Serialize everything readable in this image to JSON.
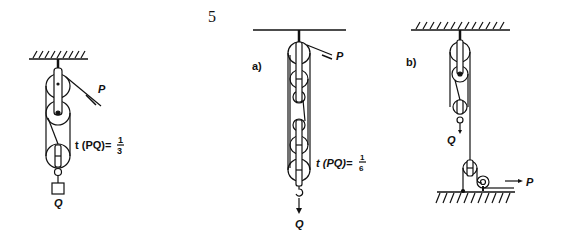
{
  "figure": {
    "number": "5",
    "panels": [
      {
        "id": "left",
        "label": "",
        "ratio_label": "t (PQ)=",
        "ratio_num": "1",
        "ratio_den": "3",
        "force_in": "P",
        "load": "Q"
      },
      {
        "id": "a",
        "label": "a)",
        "ratio_label": "t (PQ)=",
        "ratio_num": "1",
        "ratio_den": "6",
        "force_in": "P",
        "load": "Q"
      },
      {
        "id": "b",
        "label": "b)",
        "force_in": "P",
        "load": "Q"
      }
    ]
  }
}
